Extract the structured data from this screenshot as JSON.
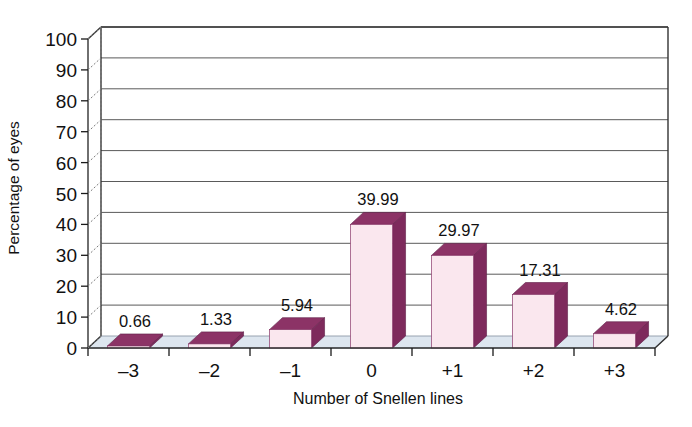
{
  "chart_data": {
    "type": "bar",
    "title": "",
    "subtitle": "",
    "xlabel": "Number of Snellen lines",
    "ylabel": "Percentage of eyes",
    "categories": [
      "–3",
      "–2",
      "–1",
      "0",
      "+1",
      "+2",
      "+3"
    ],
    "values": [
      0.66,
      1.33,
      5.94,
      39.99,
      29.97,
      17.31,
      4.62
    ],
    "data_labels": [
      "0.66",
      "1.33",
      "5.94",
      "39.99",
      "29.97",
      "17.31",
      "4.62"
    ],
    "ylim": [
      0,
      100
    ],
    "ytick_values": [
      0,
      10,
      20,
      30,
      40,
      50,
      60,
      70,
      80,
      90,
      100
    ],
    "ytick_labels": [
      "0",
      "10",
      "20",
      "30",
      "40",
      "50",
      "60",
      "70",
      "80",
      "90",
      "100"
    ],
    "grid": true,
    "grid_axis": "y",
    "legend": false,
    "legend_position": "none",
    "style": "3d-column",
    "series": [
      {
        "name": "Percentage of eyes",
        "values": [
          0.66,
          1.33,
          5.94,
          39.99,
          29.97,
          17.31,
          4.62
        ]
      }
    ],
    "colors": {
      "bar_front": "#fae7ee",
      "bar_side": "#7e2a5c",
      "bar_top": "#8c3366",
      "bar_outline": "#8b3a6b",
      "floor": "#dde6ef",
      "floor_edge": "#8f9aa8",
      "gridline": "#5a5a5a",
      "axis": "#1a1a1a",
      "text": "#111111",
      "background": "#ffffff"
    }
  },
  "caption": {
    "ghost_text": ""
  }
}
